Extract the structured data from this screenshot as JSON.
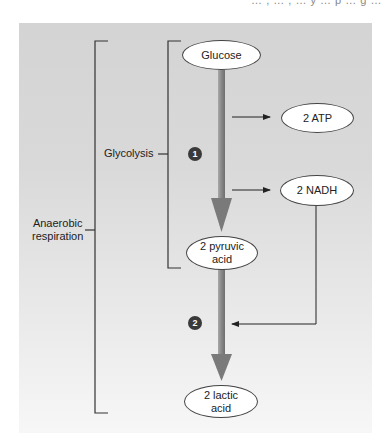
{
  "header": {
    "cut_text": "… , … , … y … p … g …"
  },
  "diagram": {
    "brackets": {
      "outer_label_line1": "Anaerobic",
      "outer_label_line2": "respiration",
      "inner_label": "Glycolysis"
    },
    "nodes": {
      "glucose": "Glucose",
      "atp": "2 ATP",
      "nadh": "2 NADH",
      "pyruvic_line1": "2 pyruvic",
      "pyruvic_line2": "acid",
      "lactic_line1": "2 lactic",
      "lactic_line2": "acid"
    },
    "steps": {
      "step1": "1",
      "step2": "2"
    },
    "colors": {
      "panel_top": "#d4d4d4",
      "panel_bottom": "#f7f7f7",
      "main_arrow": "#7f7f7f",
      "line": "#333333",
      "badge": "#3a3a3a",
      "oval_fill": "#ffffff"
    }
  }
}
